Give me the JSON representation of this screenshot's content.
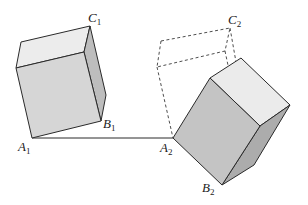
{
  "diagram": {
    "colors": {
      "front_face": "#d6d6d6",
      "top_face": "#ececec",
      "side_face": "#bdbdbd",
      "right_front_face": "#c4c4c4",
      "right_top_face": "#ebebeb",
      "right_side_face": "#acacac",
      "edge": "#2a2a2a",
      "dashed": "#3a3a3a"
    },
    "labels": {
      "A1": {
        "letter": "A",
        "sub": "1"
      },
      "B1": {
        "letter": "B",
        "sub": "1"
      },
      "C1": {
        "letter": "C",
        "sub": "1"
      },
      "A2": {
        "letter": "A",
        "sub": "2"
      },
      "B2": {
        "letter": "B",
        "sub": "2"
      },
      "C2": {
        "letter": "C",
        "sub": "2"
      }
    }
  }
}
